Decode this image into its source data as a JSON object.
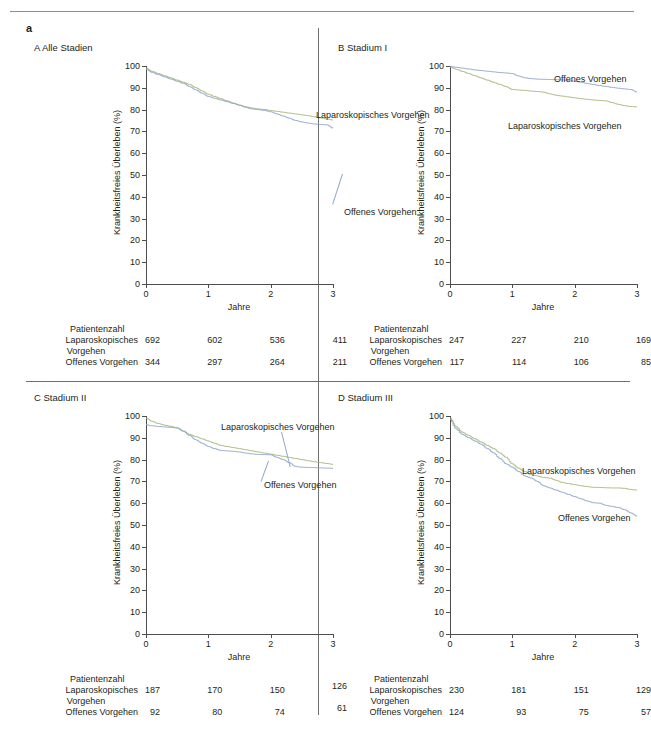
{
  "figure": {
    "letter": "a",
    "axis": {
      "y_title": "Krankheitsfreies Überleben (%)",
      "x_title": "Jahre",
      "y_ticks": [
        "0",
        "10",
        "20",
        "30",
        "40",
        "50",
        "60",
        "70",
        "80",
        "90",
        "100"
      ],
      "x_ticks": [
        "0",
        "1",
        "2",
        "3"
      ]
    },
    "risk_header": "Patientenzahl",
    "risk_row1_label": "Laparoskopisches",
    "risk_row1_label2": "Vorgehen",
    "risk_row2_label": "Offenes Vorgehen",
    "series_names": {
      "lap": "Laparoskopisches Vorgehen",
      "open": "Offenes Vorgehen"
    },
    "colors": {
      "lap": "#a9b77e",
      "open": "#8fa8c8",
      "axis": "#4d4d4d",
      "rule": "#6f6f6f",
      "text": "#231f20"
    }
  },
  "chart_data": [
    {
      "id": "A",
      "type": "line",
      "title": "A  Alle Stadien",
      "xlabel": "Jahre",
      "ylabel": "Krankheitsfreies Überleben (%)",
      "xlim": [
        0,
        3
      ],
      "ylim": [
        0,
        100
      ],
      "grid": false,
      "legend_position": "inline-annotation",
      "x": [
        0,
        0.1,
        0.2,
        0.3,
        0.4,
        0.5,
        0.6,
        0.7,
        0.8,
        0.9,
        1.0,
        1.1,
        1.2,
        1.3,
        1.4,
        1.5,
        1.6,
        1.7,
        1.8,
        1.9,
        2.0,
        2.1,
        2.2,
        2.3,
        2.4,
        2.5,
        2.6,
        2.7,
        2.8,
        2.9,
        3.0
      ],
      "series": [
        {
          "name": "Laparoskopisches Vorgehen",
          "color": "#a9b77e",
          "values": [
            99,
            97.5,
            96.5,
            95.5,
            94.5,
            93.5,
            92.5,
            91.5,
            90,
            88.5,
            87,
            86,
            85,
            84,
            83,
            82,
            81.3,
            80.7,
            80.3,
            80,
            79.6,
            79.2,
            78.8,
            78.4,
            78,
            77.6,
            77.2,
            76.7,
            76.2,
            75.7,
            75.2
          ]
        },
        {
          "name": "Offenes Vorgehen",
          "color": "#8fa8c8",
          "values": [
            98.5,
            97,
            96,
            95,
            94,
            93,
            92,
            90.5,
            89,
            87.5,
            86,
            85.2,
            84.4,
            83.6,
            82.8,
            82,
            81,
            80.3,
            80,
            79.6,
            79,
            78,
            77,
            76,
            75,
            74.3,
            73.8,
            73.4,
            73.2,
            73,
            71.5
          ]
        }
      ],
      "risk_table": {
        "header": "Patientenzahl",
        "row_labels": [
          "Laparoskopisches Vorgehen",
          "Offenes Vorgehen"
        ],
        "time_points": [
          "0",
          "1",
          "2",
          "3"
        ],
        "rows": [
          {
            "label": "Laparoskopisches Vorgehen",
            "values": [
              "692",
              "602",
              "536",
              "411"
            ]
          },
          {
            "label": "Offenes Vorgehen",
            "values": [
              "344",
              "297",
              "264",
              "211"
            ]
          }
        ]
      },
      "annotations": [
        {
          "text": "Laparoskopisches Vorgehen",
          "x_px": 170,
          "y_px": 44
        },
        {
          "text": "Offenes Vorgehen",
          "x_px": 198,
          "y_px": 141
        }
      ]
    },
    {
      "id": "B",
      "type": "line",
      "title": "B  Stadium I",
      "xlabel": "Jahre",
      "ylabel": "Krankheitsfreies Überleben (%)",
      "xlim": [
        0,
        3
      ],
      "ylim": [
        0,
        100
      ],
      "grid": false,
      "legend_position": "inline-annotation",
      "x": [
        0,
        0.1,
        0.2,
        0.3,
        0.4,
        0.5,
        0.6,
        0.7,
        0.8,
        0.9,
        1.0,
        1.1,
        1.2,
        1.3,
        1.4,
        1.5,
        1.6,
        1.7,
        1.8,
        1.9,
        2.0,
        2.1,
        2.2,
        2.3,
        2.4,
        2.5,
        2.6,
        2.7,
        2.8,
        2.9,
        3.0
      ],
      "series": [
        {
          "name": "Laparoskopisches Vorgehen",
          "color": "#a9b77e",
          "values": [
            99.5,
            98.5,
            97.5,
            96.5,
            95.5,
            94.5,
            93.5,
            92.5,
            91.5,
            90.5,
            89.2,
            89,
            88.8,
            88.5,
            88.3,
            88,
            87.2,
            86.6,
            86.2,
            85.8,
            85.4,
            85,
            84.7,
            84.4,
            84.2,
            84,
            83.2,
            82.4,
            81.8,
            81.4,
            81.2
          ]
        },
        {
          "name": "Offenes Vorgehen",
          "color": "#8fa8c8",
          "values": [
            99.8,
            99.4,
            99,
            98.6,
            98.2,
            97.9,
            97.6,
            97.3,
            97,
            96.8,
            96.5,
            95.4,
            94.6,
            94.2,
            94,
            93.9,
            93.8,
            93.7,
            93.6,
            93.4,
            93,
            92.5,
            92,
            91.5,
            91,
            90.6,
            90.2,
            89.8,
            89.5,
            89.2,
            88
          ]
        }
      ],
      "risk_table": {
        "header": "Patientenzahl",
        "row_labels": [
          "Laparoskopisches Vorgehen",
          "Offenes Vorgehen"
        ],
        "time_points": [
          "0",
          "1",
          "2",
          "3"
        ],
        "rows": [
          {
            "label": "Laparoskopisches Vorgehen",
            "values": [
              "247",
              "227",
              "210",
              "169"
            ]
          },
          {
            "label": "Offenes Vorgehen",
            "values": [
              "117",
              "114",
              "106",
              "85"
            ]
          }
        ]
      },
      "annotations": [
        {
          "text": "Offenes Vorgehen",
          "x_px": 104,
          "y_px": 8
        },
        {
          "text": "Laparoskopisches Vorgehen",
          "x_px": 58,
          "y_px": 55
        }
      ]
    },
    {
      "id": "C",
      "type": "line",
      "title": "C  Stadium II",
      "xlabel": "Jahre",
      "ylabel": "Krankheitsfreies Überleben (%)",
      "xlim": [
        0,
        3
      ],
      "ylim": [
        0,
        100
      ],
      "grid": false,
      "legend_position": "inline-annotation",
      "x": [
        0,
        0.1,
        0.2,
        0.3,
        0.4,
        0.5,
        0.6,
        0.7,
        0.8,
        0.9,
        1.0,
        1.1,
        1.2,
        1.3,
        1.4,
        1.5,
        1.6,
        1.7,
        1.8,
        1.9,
        2.0,
        2.1,
        2.2,
        2.3,
        2.4,
        2.5,
        2.6,
        2.7,
        2.8,
        2.9,
        3.0
      ],
      "series": [
        {
          "name": "Laparoskopisches Vorgehen",
          "color": "#a9b77e",
          "values": [
            99,
            97.5,
            96.5,
            95.8,
            95.2,
            94.5,
            93,
            91.5,
            90.5,
            89.5,
            88.5,
            87.5,
            86.5,
            86,
            85.5,
            85,
            84.5,
            84,
            83.5,
            83,
            82.5,
            82,
            81.5,
            81,
            80.5,
            80,
            79.5,
            79,
            78.6,
            78.2,
            77.8
          ]
        },
        {
          "name": "Offenes Vorgehen",
          "color": "#8fa8c8",
          "values": [
            96,
            95.5,
            95.2,
            95,
            94.8,
            94.5,
            93,
            91,
            89,
            87.5,
            86,
            85,
            84.2,
            84,
            83.8,
            83.5,
            83,
            82.6,
            82.4,
            82.3,
            82.2,
            81,
            80,
            78.5,
            76.8,
            76.5,
            76.4,
            76.3,
            76.2,
            76.1,
            76
          ]
        }
      ],
      "risk_table": {
        "header": "Patientenzahl",
        "row_labels": [
          "Laparoskopisches Vorgehen",
          "Offenes Vorgehen"
        ],
        "time_points": [
          "0",
          "1",
          "2",
          "3"
        ],
        "rows": [
          {
            "label": "Laparoskopisches Vorgehen",
            "values": [
              "187",
              "170",
              "150",
              "126"
            ]
          },
          {
            "label": "Offenes Vorgehen",
            "values": [
              "92",
              "80",
              "74",
              "61"
            ]
          }
        ]
      },
      "annotations": [
        {
          "text": "Laparoskopisches Vorgehen",
          "x_px": 75,
          "y_px": 6
        },
        {
          "text": "Offenes Vorgehen",
          "x_px": 118,
          "y_px": 64
        }
      ]
    },
    {
      "id": "D",
      "type": "line",
      "title": "D  Stadium III",
      "xlabel": "Jahre",
      "ylabel": "Krankheitsfreies Überleben (%)",
      "xlim": [
        0,
        3
      ],
      "ylim": [
        0,
        100
      ],
      "grid": false,
      "legend_position": "inline-annotation",
      "x": [
        0,
        0.1,
        0.2,
        0.3,
        0.4,
        0.5,
        0.6,
        0.7,
        0.8,
        0.9,
        1.0,
        1.1,
        1.2,
        1.3,
        1.4,
        1.5,
        1.6,
        1.7,
        1.8,
        1.9,
        2.0,
        2.1,
        2.2,
        2.3,
        2.4,
        2.5,
        2.6,
        2.7,
        2.8,
        2.9,
        3.0
      ],
      "series": [
        {
          "name": "Laparoskopisches Vorgehen",
          "color": "#a9b77e",
          "values": [
            99,
            95,
            92.5,
            91,
            89.5,
            88,
            86.5,
            85,
            83,
            81,
            78,
            76,
            74.5,
            73,
            72.5,
            71.8,
            71.5,
            70.5,
            69.5,
            69,
            68.5,
            68,
            67.6,
            67.3,
            67.2,
            67.1,
            67,
            67,
            66.8,
            66.3,
            66
          ]
        },
        {
          "name": "Offenes Vorgehen",
          "color": "#8fa8c8",
          "values": [
            98.5,
            94,
            91.5,
            90,
            88.5,
            87,
            85,
            83,
            80.5,
            78,
            76.5,
            74.5,
            72.5,
            71.5,
            70,
            68,
            67,
            66,
            65,
            64,
            63,
            62,
            61,
            60.2,
            60,
            59,
            58.5,
            58,
            57,
            55.5,
            54
          ]
        }
      ],
      "risk_table": {
        "header": "Patientenzahl",
        "row_labels": [
          "Laparoskopisches Vorgehen",
          "Offenes Vorgehen"
        ],
        "time_points": [
          "0",
          "1",
          "2",
          "3"
        ],
        "rows": [
          {
            "label": "Laparoskopisches Vorgehen",
            "values": [
              "230",
              "181",
              "151",
              "129"
            ]
          },
          {
            "label": "Offenes Vorgehen",
            "values": [
              "124",
              "93",
              "75",
              "57"
            ]
          }
        ]
      },
      "annotations": [
        {
          "text": "Laparoskopisches Vorgehen",
          "x_px": 72,
          "y_px": 50
        },
        {
          "text": "Offenes Vorgehen",
          "x_px": 108,
          "y_px": 97
        }
      ]
    }
  ]
}
